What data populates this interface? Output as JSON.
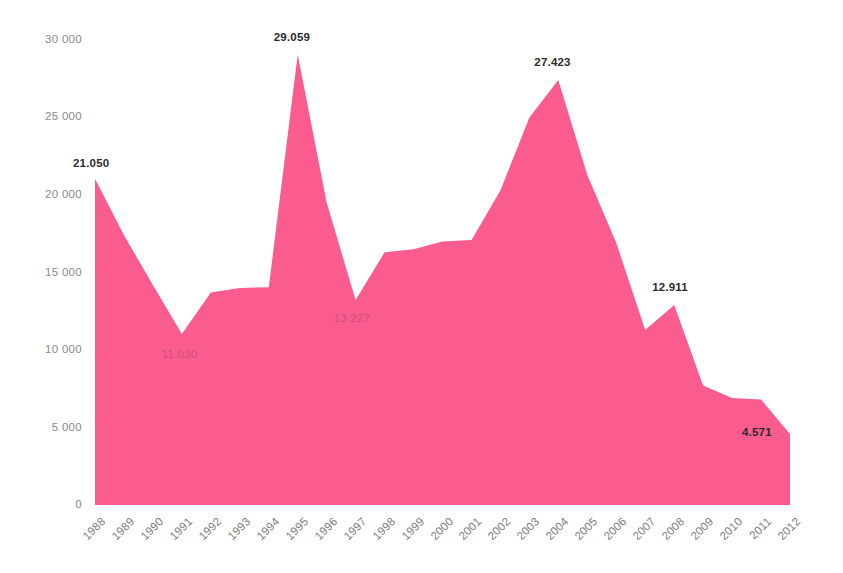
{
  "chart_data": {
    "type": "area",
    "title": "",
    "subtitle": "",
    "xlabel": "",
    "ylabel": "",
    "categories": [
      "1988",
      "1989",
      "1990",
      "1991",
      "1992",
      "1993",
      "1994",
      "1995",
      "1996",
      "1997",
      "1998",
      "1999",
      "2000",
      "2001",
      "2002",
      "2003",
      "2004",
      "2005",
      "2006",
      "2007",
      "2008",
      "2009",
      "2010",
      "2011",
      "2012"
    ],
    "values": [
      21050,
      17400,
      14200,
      11030,
      13700,
      14000,
      14050,
      29059,
      19500,
      13227,
      16300,
      16500,
      17000,
      17100,
      20300,
      25000,
      27423,
      21300,
      16900,
      11300,
      12911,
      7700,
      6900,
      6800,
      4571
    ],
    "series": [
      {
        "name": "",
        "values": [
          21050,
          17400,
          14200,
          11030,
          13700,
          14000,
          14050,
          29059,
          19500,
          13227,
          16300,
          16500,
          17000,
          17100,
          20300,
          25000,
          27423,
          21300,
          16900,
          11300,
          12911,
          7700,
          6900,
          6800,
          4571
        ]
      }
    ],
    "ylim": [
      0,
      30000
    ],
    "yticks": [
      0,
      5000,
      10000,
      15000,
      20000,
      25000,
      30000
    ],
    "ytick_labels": [
      "0",
      "5 000",
      "10 000",
      "15 000",
      "20 000",
      "25 000",
      "30 000"
    ],
    "grid": false,
    "legend": false,
    "legend_position": "none",
    "area_color": "#FA5C8D",
    "data_labels": [
      {
        "category": "1988",
        "value": 21050,
        "text": "21.050",
        "style": "dark"
      },
      {
        "category": "1991",
        "value": 11030,
        "text": "11.030",
        "style": "faint"
      },
      {
        "category": "1995",
        "value": 29059,
        "text": "29.059",
        "style": "dark"
      },
      {
        "category": "1997",
        "value": 13227,
        "text": "13.227",
        "style": "faint"
      },
      {
        "category": "2004",
        "value": 27423,
        "text": "27.423",
        "style": "dark"
      },
      {
        "category": "2008",
        "value": 12911,
        "text": "12.911",
        "style": "dark"
      },
      {
        "category": "2012",
        "value": 4571,
        "text": "4.571",
        "style": "dark"
      }
    ]
  },
  "axes": {
    "y_labels": [
      "30 000",
      "25 000",
      "20 000",
      "15 000",
      "10 000",
      "5 000",
      "0"
    ],
    "x_labels": [
      "1988",
      "1989",
      "1990",
      "1991",
      "1992",
      "1993",
      "1994",
      "1995",
      "1996",
      "1997",
      "1998",
      "1999",
      "2000",
      "2001",
      "2002",
      "2003",
      "2004",
      "2005",
      "2006",
      "2007",
      "2008",
      "2009",
      "2010",
      "2011",
      "2012"
    ]
  },
  "labels": {
    "l1988": "21.050",
    "l1991": "11.030",
    "l1995": "29.059",
    "l1997": "13.227",
    "l2004": "27.423",
    "l2008": "12.911",
    "l2012": "4.571"
  }
}
